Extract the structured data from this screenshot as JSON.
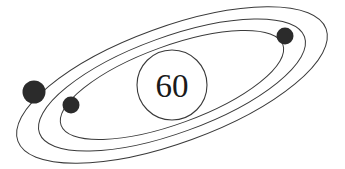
{
  "figure": {
    "width": 345,
    "height": 169,
    "background_color": "#ffffff"
  },
  "nucleus": {
    "label": "60",
    "center_x": 172,
    "center_y": 85,
    "radius": 35,
    "fill_color": "#ffffff",
    "stroke_color": "#3a3a3a",
    "stroke_width": 1.1,
    "text_color": "#1a1a1a",
    "font_size": 33
  },
  "orbits": [
    {
      "name": "outer-orbit",
      "rx": 164,
      "ry": 58,
      "rotation_deg": -20,
      "stroke_color": "#3a3a3a",
      "stroke_width": 1.0
    },
    {
      "name": "middle-orbit",
      "rx": 141,
      "ry": 48,
      "rotation_deg": -20,
      "stroke_color": "#3a3a3a",
      "stroke_width": 1.0
    },
    {
      "name": "inner-orbit",
      "rx": 118,
      "ry": 39,
      "rotation_deg": -20,
      "stroke_color": "#3a3a3a",
      "stroke_width": 1.0
    }
  ],
  "electrons": [
    {
      "name": "electron-left-large",
      "cx": 34,
      "cy": 92,
      "r": 11.5,
      "color": "#2b2b2b"
    },
    {
      "name": "electron-left-small",
      "cx": 71,
      "cy": 105,
      "r": 8.5,
      "color": "#2b2b2b"
    },
    {
      "name": "electron-right",
      "cx": 285,
      "cy": 36,
      "r": 8.5,
      "color": "#2b2b2b"
    }
  ],
  "colors": {
    "line": "#3a3a3a",
    "dot": "#2b2b2b",
    "text": "#1a1a1a",
    "background": "#ffffff"
  }
}
